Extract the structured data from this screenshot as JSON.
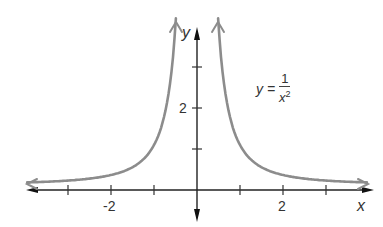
{
  "chart_data": {
    "type": "line",
    "title": "",
    "equation_label": {
      "lhs": "y =",
      "numerator": "1",
      "denominator_base": "x",
      "denominator_exp": "2"
    },
    "function": "y = 1/x^2",
    "xlabel": "x",
    "ylabel": "y",
    "xlim": [
      -4.5,
      4.3
    ],
    "ylim": [
      0,
      4.1
    ],
    "x_ticks": [
      -3,
      -2,
      -1,
      1,
      2,
      3
    ],
    "x_tick_labels": [
      {
        "value": -2,
        "label": "-2"
      },
      {
        "value": 2,
        "label": "2"
      }
    ],
    "y_ticks": [
      1,
      2,
      3
    ],
    "y_tick_labels": [
      {
        "value": 2,
        "label": "2"
      }
    ],
    "grid": false,
    "legend": "none",
    "series": [
      {
        "name": "left branch",
        "x": [
          -3.9,
          -3,
          -2,
          -1.5,
          -1,
          -0.75,
          -0.6,
          -0.5
        ],
        "values": [
          0.066,
          0.111,
          0.25,
          0.444,
          1.0,
          1.778,
          2.778,
          4.0
        ]
      },
      {
        "name": "right branch",
        "x": [
          0.5,
          0.6,
          0.75,
          1,
          1.5,
          2,
          3,
          4.0
        ],
        "values": [
          4.0,
          2.778,
          1.778,
          1.0,
          0.444,
          0.25,
          0.111,
          0.0625
        ]
      }
    ],
    "colors": {
      "curve": "#8c8c8c",
      "axes": "#222222",
      "text": "#333333"
    }
  },
  "labels": {
    "x_axis": "x",
    "y_axis": "y",
    "tick_neg2": "-2",
    "tick_pos2": "2",
    "tick_y2": "2",
    "eq_lhs": "y =",
    "eq_num": "1",
    "eq_den": "x",
    "eq_exp": "2"
  }
}
